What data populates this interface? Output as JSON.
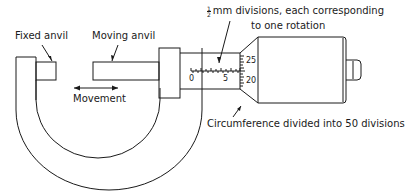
{
  "diagram": {
    "labels": {
      "fixed_anvil": "Fixed anvil",
      "moving_anvil": "Moving anvil",
      "movement": "Movement",
      "divisions_fraction_num": "1",
      "divisions_fraction_den": "2",
      "divisions_line1": "mm divisions, each corresponding",
      "divisions_line2": "to one rotation",
      "circumference": "Circumference divided into 50 divisions"
    },
    "sleeve_scale": {
      "start": "0",
      "mid": "5"
    },
    "thimble_scale": {
      "upper": "25",
      "lower": "20"
    },
    "colors": {
      "line": "#1a1a1a",
      "background": "#ffffff"
    }
  }
}
